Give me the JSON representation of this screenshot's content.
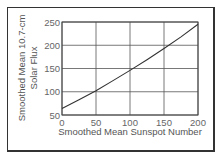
{
  "chart_data": {
    "type": "line",
    "title": "",
    "xlabel": "Smoothed Mean Sunspot Number",
    "ylabel_lines": [
      "Smoothed Mean 10.7-cm",
      "Solar Flux"
    ],
    "ylabel": "Smoothed Mean 10.7-cm Solar Flux",
    "xlim": [
      0,
      200
    ],
    "ylim": [
      50,
      250
    ],
    "x_ticks": [
      0,
      50,
      100,
      150,
      200
    ],
    "y_ticks": [
      50,
      100,
      150,
      200,
      250
    ],
    "x_tick_labels": [
      "0",
      "50",
      "100",
      "150",
      "200"
    ],
    "y_tick_labels": [
      "50",
      "100",
      "150",
      "200",
      "250"
    ],
    "grid": true,
    "legend": null,
    "series": [
      {
        "name": "Solar Flux vs Sunspot Number",
        "x": [
          0,
          25,
          50,
          75,
          100,
          125,
          150,
          175,
          200
        ],
        "values": [
          64,
          83,
          102,
          124,
          146,
          169,
          193,
          218,
          245
        ]
      }
    ],
    "colors": {
      "line": "#333333",
      "grid": "#555555",
      "frame": "#333333"
    }
  }
}
